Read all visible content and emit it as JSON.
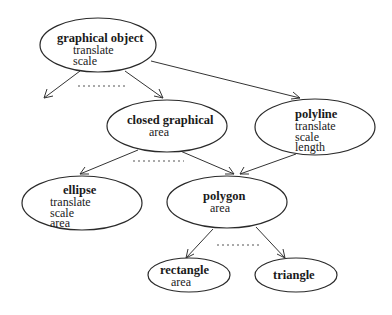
{
  "diagram": {
    "type": "class-hierarchy",
    "nodes": {
      "graphical_object": {
        "title": "graphical object",
        "attrs": [
          "translate",
          "scale"
        ]
      },
      "closed_graphical": {
        "title": "closed graphical",
        "attrs": [
          "area"
        ]
      },
      "polyline": {
        "title": "polyline",
        "attrs": [
          "translate",
          "scale",
          "length"
        ]
      },
      "ellipse": {
        "title": "ellipse",
        "attrs": [
          "translate",
          "scale",
          "area"
        ]
      },
      "polygon": {
        "title": "polygon",
        "attrs": [
          "area"
        ]
      },
      "rectangle": {
        "title": "rectangle",
        "attrs": [
          "area"
        ]
      },
      "triangle": {
        "title": "triangle",
        "attrs": []
      }
    },
    "edges": [
      {
        "from": "graphical object",
        "to": "(unnamed subclass)"
      },
      {
        "from": "graphical object",
        "to": "closed graphical"
      },
      {
        "from": "graphical object",
        "to": "polyline"
      },
      {
        "from": "closed graphical",
        "to": "ellipse"
      },
      {
        "from": "closed graphical",
        "to": "polygon"
      },
      {
        "from": "polyline",
        "to": "polygon"
      },
      {
        "from": "polygon",
        "to": "rectangle"
      },
      {
        "from": "polygon",
        "to": "triangle"
      }
    ],
    "ellipsis_markers": 3,
    "colors": {
      "stroke": "#2a2a2a",
      "background": "#ffffff",
      "text": "#1a1a1a"
    }
  }
}
